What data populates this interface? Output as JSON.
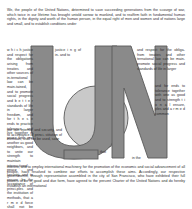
{
  "document": {
    "title": "United Nations Charter Preamble",
    "kind": "typographic-poster",
    "background_color": "#ffffff",
    "text_color": "#2e2e2e"
  },
  "logo": {
    "name": "un-monogram",
    "letters": "UN",
    "fill_color": "#8a8a8a",
    "circle_fill_color": "#c9c9c9",
    "stroke_color": "#5a5a5a"
  },
  "body": {
    "top_paragraph": "We, the people of the United Nations, determined to save succeeding generations from the scourge of war, which twice in our lifetime has brought untold sorrow to mankind, and to reaffirm faith in fundamental human rights, in the dignity and worth of the human person, in the equal right of men and women and of nations large and small, and to establish conditions under",
    "column_left_top": "w h i c h  justice and respect for the obligations arising from treaties and other sources of in-ternational law can be main-tained, and to promote social progress and b e t t e r standards of life in larger freedom, and for t h e s e ends to practice tolerance and live together in peace with one another as good neighbors, and to unite our strength to maintain interna-tional peace and security, and to ensure, by the acceptance of princi-ples and the institution of methods, that a r m e d force shall not be used, save in the common",
    "column_middle_top": "justice i n g of in- and to",
    "column_right_top": "and respect for the obliga- from treaties and other ternational law can be main- promote social progress and standards of life in larger",
    "column_right_lower": "and for ends to tolerance together with one as good and to strength t i o n a l ensure, ples and a r m e d common",
    "column_left_lower": "our tain interna- and security, and to acceptance of princi- stitution of methods, shall not be used, save",
    "fragment_that": "that",
    "fragment_in_the": "in the",
    "bottom_paragraph": "interest, and to employ international machinery for the promotion of the economic and social advancement of all people, have resolved to combine our efforts to accomplish these aims. Accordingly, our respective governments, through representative assembled in the city of San Francisco, who have exhibited their full powers to be in good and due form, have agreed to the present Charter of the United Nations and do hereby establish an international"
  },
  "columns": {
    "left": [
      "w h i c h",
      "tions aris-",
      "sources",
      "t a i n e d ,",
      "b e t t e r",
      "freedom,",
      "t h e s e",
      "practice",
      "and live",
      "in peace",
      "another",
      "neighbors,",
      "unite    our",
      "to maintain interna-",
      "peace and security, and to",
      "by the acceptance of princi-"
    ],
    "middle": [
      "justice",
      "i n g",
      "of in-",
      "and to"
    ],
    "right": [
      "and respect for the obliga-",
      "from  treaties  and  other",
      "ternational law can be main-",
      "promote social progress and",
      "standards of life in larger",
      "and      for",
      "ends    to",
      "tolerance",
      "together",
      "with one",
      "as   good",
      "and     to",
      "strength",
      "t i o n a l",
      "ensure,",
      "ples and",
      "a r m e d",
      "common"
    ],
    "left_lower": [
      "the institution of methods,",
      "force shall not be used, save"
    ],
    "small_fragments": [
      "that",
      "in  the"
    ]
  }
}
